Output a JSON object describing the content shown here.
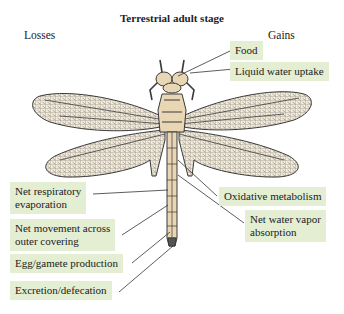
{
  "title": "Terrestrial adult stage",
  "columns": {
    "left": "Losses",
    "right": "Gains"
  },
  "gains": [
    {
      "label": "Food"
    },
    {
      "label": "Liquid water uptake"
    },
    {
      "label": "Oxidative metabolism"
    },
    {
      "label": "Net water vapor absorption",
      "lines": [
        "Net water vapor",
        "absorption"
      ]
    }
  ],
  "losses": [
    {
      "label": "Net respiratory evaporation",
      "lines": [
        "Net respiratory",
        "evaporation"
      ]
    },
    {
      "label": "Net movement across outer covering",
      "lines": [
        "Net movement across",
        "outer covering"
      ]
    },
    {
      "label": "Egg/gamete production"
    },
    {
      "label": "Excretion/defecation"
    }
  ],
  "colors": {
    "label_box": "#e3eed3",
    "body": "#e8d6b4",
    "wing": "#f1ebdc",
    "outline": "#3a3a3a"
  }
}
